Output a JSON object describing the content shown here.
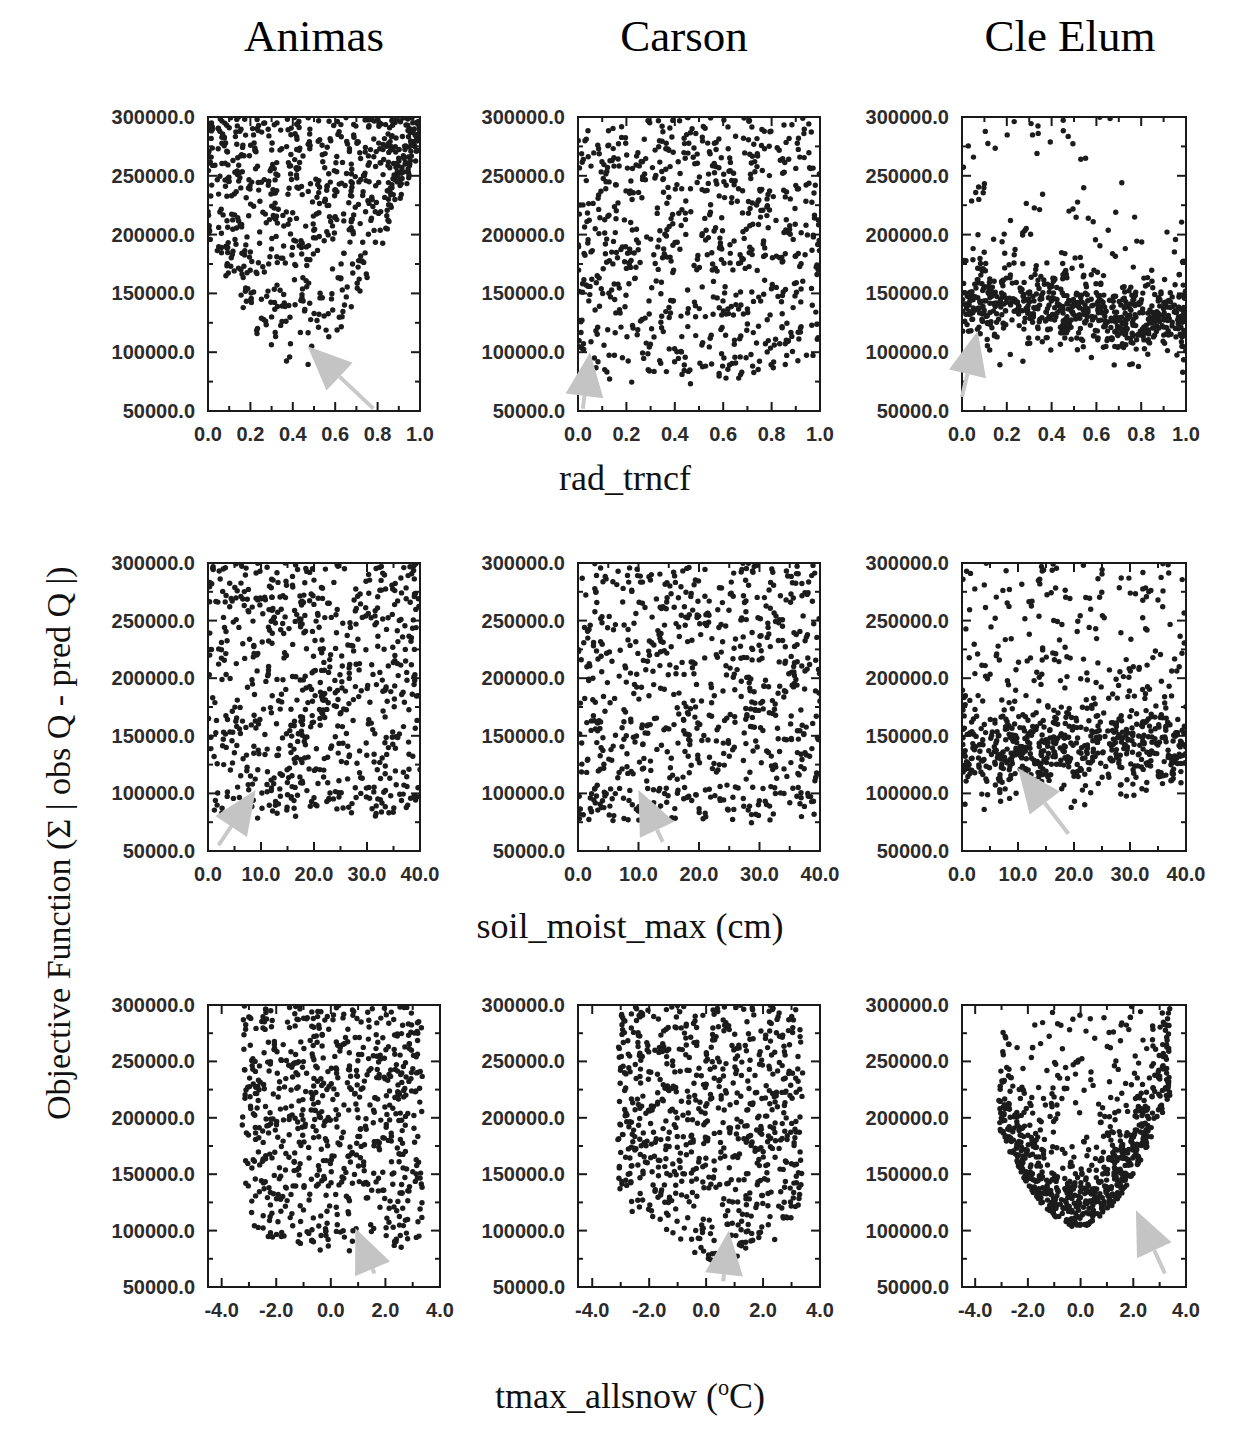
{
  "figure": {
    "columns": [
      {
        "title": "Animas"
      },
      {
        "title": "Carson"
      },
      {
        "title": "Cle Elum"
      }
    ],
    "y_axis_label": "Objective Function (Σ | obs Q - pred Q |)",
    "row_labels": [
      "rad_trncf",
      "soil_moist_max (cm)",
      "tmax_allsnow (°C)"
    ],
    "colors": {
      "dot": "#1c1c1c",
      "frame": "#1a1a1a",
      "arrow": "#c4c4c4",
      "tick_text": "#2b2b2b",
      "background": "#ffffff"
    }
  },
  "chart_data": [
    {
      "type": "scatter",
      "title": "Animas",
      "xlabel": "rad_trncf",
      "ylabel": "Objective Function (Σ | obs Q - pred Q |)",
      "xlim": [
        0.0,
        1.0
      ],
      "ylim": [
        50000.0,
        300000.0
      ],
      "xticks": [
        0.0,
        0.2,
        0.4,
        0.6,
        0.8,
        1.0
      ],
      "xticklabels": [
        "0.0",
        "0.2",
        "0.4",
        "0.6",
        "0.8",
        "1.0"
      ],
      "yticks": [
        50000.0,
        100000.0,
        150000.0,
        200000.0,
        250000.0,
        300000.0
      ],
      "yticklabels": [
        "50000.0",
        "100000.0",
        "150000.0",
        "200000.0",
        "250000.0",
        "300000.0"
      ],
      "grid": false,
      "n_points": 700,
      "shape": "wedge-min-at-0.4",
      "annotation": {
        "type": "arrow",
        "points_to_x": 0.47,
        "points_to_y": 105000,
        "tail_x": 0.78,
        "tail_y": 52000
      },
      "description": "Dense cloud narrowing to a minimum near rad_trncf 0.35-0.5 with lowest objective ~82000; spreads upward to 300000 at both edges."
    },
    {
      "type": "scatter",
      "title": "Carson",
      "xlabel": "rad_trncf",
      "ylabel": "Objective Function (Σ | obs Q - pred Q |)",
      "xlim": [
        0.0,
        1.0
      ],
      "ylim": [
        50000.0,
        300000.0
      ],
      "xticks": [
        0.0,
        0.2,
        0.4,
        0.6,
        0.8,
        1.0
      ],
      "xticklabels": [
        "0.0",
        "0.2",
        "0.4",
        "0.6",
        "0.8",
        "1.0"
      ],
      "yticks": [
        50000.0,
        100000.0,
        150000.0,
        200000.0,
        250000.0,
        300000.0
      ],
      "yticklabels": [
        "50000.0",
        "100000.0",
        "150000.0",
        "200000.0",
        "250000.0",
        "300000.0"
      ],
      "grid": false,
      "n_points": 720,
      "shape": "decreasing-lower-envelope",
      "annotation": {
        "type": "arrow",
        "points_to_x": 0.05,
        "points_to_y": 100000,
        "tail_x": 0.02,
        "tail_y": 52000
      },
      "description": "Lower envelope drops from ~100000 near x=0 to ~70000 around x=0.3-0.7; broad spread to 300000."
    },
    {
      "type": "scatter",
      "title": "Cle Elum",
      "xlabel": "rad_trncf",
      "ylabel": "Objective Function (Σ | obs Q - pred Q |)",
      "xlim": [
        0.0,
        1.0
      ],
      "ylim": [
        50000.0,
        300000.0
      ],
      "xticks": [
        0.0,
        0.2,
        0.4,
        0.6,
        0.8,
        1.0
      ],
      "xticklabels": [
        "0.0",
        "0.2",
        "0.4",
        "0.6",
        "0.8",
        "1.0"
      ],
      "yticks": [
        50000.0,
        100000.0,
        150000.0,
        200000.0,
        250000.0,
        300000.0
      ],
      "yticklabels": [
        "50000.0",
        "100000.0",
        "150000.0",
        "200000.0",
        "250000.0",
        "300000.0"
      ],
      "grid": false,
      "n_points": 760,
      "shape": "tight-band-130000",
      "annotation": {
        "type": "arrow",
        "points_to_x": 0.07,
        "points_to_y": 118000,
        "tail_x": 0.0,
        "tail_y": 62000
      },
      "description": "Very tight horizontal band centered near 135000 across the full range; sparse high-value tail concentrated near x=0."
    },
    {
      "type": "scatter",
      "title": "Animas",
      "xlabel": "soil_moist_max (cm)",
      "ylabel": "Objective Function (Σ | obs Q - pred Q |)",
      "xlim": [
        0.0,
        40.0
      ],
      "ylim": [
        50000.0,
        300000.0
      ],
      "xticks": [
        0.0,
        10.0,
        20.0,
        30.0,
        40.0
      ],
      "xticklabels": [
        "0.0",
        "10.0",
        "20.0",
        "30.0",
        "40.0"
      ],
      "yticks": [
        50000.0,
        100000.0,
        150000.0,
        200000.0,
        250000.0,
        300000.0
      ],
      "yticklabels": [
        "50000.0",
        "100000.0",
        "150000.0",
        "200000.0",
        "250000.0",
        "300000.0"
      ],
      "grid": false,
      "n_points": 700,
      "shape": "uniform-scatter",
      "annotation": {
        "type": "arrow",
        "points_to_x": 9.0,
        "points_to_y": 103000,
        "tail_x": 2.0,
        "tail_y": 55000
      },
      "description": "Nearly uniform scatter across 0-40 cm spanning 80000-300000, insensitive parameter."
    },
    {
      "type": "scatter",
      "title": "Carson",
      "xlabel": "soil_moist_max (cm)",
      "ylabel": "Objective Function (Σ | obs Q - pred Q |)",
      "xlim": [
        0.0,
        40.0
      ],
      "ylim": [
        50000.0,
        300000.0
      ],
      "xticks": [
        0.0,
        10.0,
        20.0,
        30.0,
        40.0
      ],
      "xticklabels": [
        "0.0",
        "10.0",
        "20.0",
        "30.0",
        "40.0"
      ],
      "yticks": [
        50000.0,
        100000.0,
        150000.0,
        200000.0,
        250000.0,
        300000.0
      ],
      "yticklabels": [
        "50000.0",
        "100000.0",
        "150000.0",
        "200000.0",
        "250000.0",
        "300000.0"
      ],
      "grid": false,
      "n_points": 720,
      "shape": "uniform-scatter",
      "annotation": {
        "type": "arrow",
        "points_to_x": 10.0,
        "points_to_y": 103000,
        "tail_x": 14.0,
        "tail_y": 58000
      },
      "description": "Nearly uniform scatter across 0-40 cm spanning 75000-300000, insensitive parameter."
    },
    {
      "type": "scatter",
      "title": "Cle Elum",
      "xlabel": "soil_moist_max (cm)",
      "ylabel": "Objective Function (Σ | obs Q - pred Q |)",
      "xlim": [
        0.0,
        40.0
      ],
      "ylim": [
        50000.0,
        300000.0
      ],
      "xticks": [
        0.0,
        10.0,
        20.0,
        30.0,
        40.0
      ],
      "xticklabels": [
        "0.0",
        "10.0",
        "20.0",
        "30.0",
        "40.0"
      ],
      "yticks": [
        50000.0,
        100000.0,
        150000.0,
        200000.0,
        250000.0,
        300000.0
      ],
      "yticklabels": [
        "50000.0",
        "100000.0",
        "150000.0",
        "200000.0",
        "250000.0",
        "300000.0"
      ],
      "grid": false,
      "n_points": 760,
      "shape": "dense-band-140000",
      "annotation": {
        "type": "arrow",
        "points_to_x": 10.0,
        "points_to_y": 122000,
        "tail_x": 19.0,
        "tail_y": 65000
      },
      "description": "Dense horizontal band between 105000 and 175000 centered near 140000, plus sparse upper scatter to 300000."
    },
    {
      "type": "scatter",
      "title": "Animas",
      "xlabel": "tmax_allsnow (°C)",
      "ylabel": "Objective Function (Σ | obs Q - pred Q |)",
      "xlim": [
        -4.5,
        4.0
      ],
      "ylim": [
        50000.0,
        300000.0
      ],
      "xticks": [
        -4.0,
        -2.0,
        0.0,
        2.0,
        4.0
      ],
      "xticklabels": [
        "-4.0",
        "-2.0",
        "0.0",
        "2.0",
        "4.0"
      ],
      "yticks": [
        50000.0,
        100000.0,
        150000.0,
        200000.0,
        250000.0,
        300000.0
      ],
      "yticklabels": [
        "50000.0",
        "100000.0",
        "150000.0",
        "200000.0",
        "250000.0",
        "300000.0"
      ],
      "grid": false,
      "n_points": 700,
      "shape": "uniform-band-x-limited",
      "annotation": {
        "type": "arrow",
        "points_to_x": 0.9,
        "points_to_y": 102000,
        "tail_x": 1.6,
        "tail_y": 62000
      },
      "description": "Points confined to -3.2 to 3.4 °C, roughly uniform from 90000 to 300000 with slight low-value cluster near 0-2 °C."
    },
    {
      "type": "scatter",
      "title": "Carson",
      "xlabel": "tmax_allsnow (°C)",
      "ylabel": "Objective Function (Σ | obs Q - pred Q |)",
      "xlim": [
        -4.5,
        4.0
      ],
      "ylim": [
        50000.0,
        300000.0
      ],
      "xticks": [
        -4.0,
        -2.0,
        0.0,
        2.0,
        4.0
      ],
      "xticklabels": [
        "-4.0",
        "-2.0",
        "0.0",
        "2.0",
        "4.0"
      ],
      "yticks": [
        50000.0,
        100000.0,
        150000.0,
        200000.0,
        250000.0,
        300000.0
      ],
      "yticklabels": [
        "50000.0",
        "100000.0",
        "150000.0",
        "200000.0",
        "250000.0",
        "300000.0"
      ],
      "grid": false,
      "n_points": 720,
      "shape": "lower-envelope-min-near-0.5",
      "annotation": {
        "type": "arrow",
        "points_to_x": 0.8,
        "points_to_y": 100000,
        "tail_x": 0.6,
        "tail_y": 55000
      },
      "description": "Lower envelope dips to ~70000 near 0 to 1 °C; spread extends to 300000, points span -3.2 to 3.4 °C."
    },
    {
      "type": "scatter",
      "title": "Cle Elum",
      "xlabel": "tmax_allsnow (°C)",
      "ylabel": "Objective Function (Σ | obs Q - pred Q |)",
      "xlim": [
        -4.5,
        4.0
      ],
      "ylim": [
        50000.0,
        300000.0
      ],
      "xticks": [
        -4.0,
        -2.0,
        0.0,
        2.0,
        4.0
      ],
      "xticklabels": [
        "-4.0",
        "-2.0",
        "0.0",
        "2.0",
        "4.0"
      ],
      "yticks": [
        50000.0,
        100000.0,
        150000.0,
        200000.0,
        250000.0,
        300000.0
      ],
      "yticklabels": [
        "50000.0",
        "100000.0",
        "150000.0",
        "200000.0",
        "250000.0",
        "300000.0"
      ],
      "grid": false,
      "n_points": 780,
      "shape": "u-shaped-min-near-0",
      "annotation": {
        "type": "arrow",
        "points_to_x": 2.1,
        "points_to_y": 118000,
        "tail_x": 3.2,
        "tail_y": 62000
      },
      "description": "Pronounced U-shaped response: dense lower envelope falling from ~170000 at -3 °C to minimum ~103000 near 0 °C, rising again past 2 °C toward 300000."
    }
  ]
}
